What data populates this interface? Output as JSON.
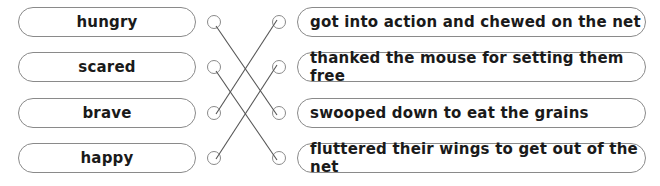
{
  "exercise": {
    "left_items": [
      {
        "label": "hungry"
      },
      {
        "label": "scared"
      },
      {
        "label": "brave"
      },
      {
        "label": "happy"
      }
    ],
    "right_items": [
      {
        "label": "got into action and chewed on the net"
      },
      {
        "label": "thanked the mouse for setting them free"
      },
      {
        "label": "swooped down to eat the grains"
      },
      {
        "label": "fluttered their wings to get out of the net"
      }
    ],
    "matches": [
      {
        "left": "hungry",
        "right": "swooped down to eat the grains"
      },
      {
        "left": "scared",
        "right": "fluttered their wings to get out of the net"
      },
      {
        "left": "brave",
        "right": "got into action and chewed on the net"
      },
      {
        "left": "happy",
        "right": "thanked the mouse for setting them free"
      }
    ],
    "line_color": "#555555",
    "border_color": "#8a8a8a"
  }
}
